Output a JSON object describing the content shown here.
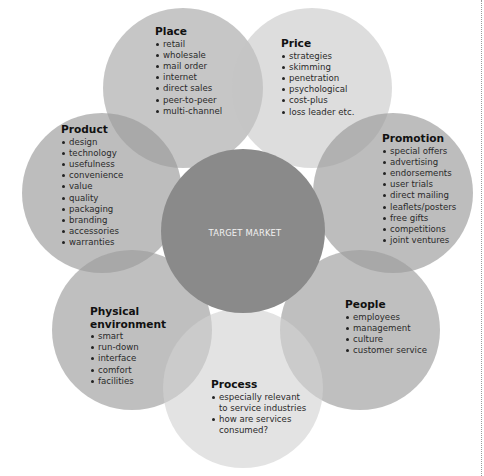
{
  "diagram": {
    "center": {
      "label": "TARGET MARKET",
      "color": "#8a8a8a"
    },
    "petals": [
      {
        "id": "place",
        "title": "Place",
        "color": "#c4c4c4",
        "items": [
          "retail",
          "wholesale",
          "mail order",
          "internet",
          "direct sales",
          "peer-to-peer",
          "multi-channel"
        ]
      },
      {
        "id": "price",
        "title": "Price",
        "color": "#dcdcdc",
        "items": [
          "strategies",
          "skimming",
          "penetration",
          "psychological",
          "cost-plus",
          "loss leader etc."
        ]
      },
      {
        "id": "promotion",
        "title": "Promotion",
        "color": "#b9b9b9",
        "items": [
          "special offers",
          "advertising",
          "endorsements",
          "user trials",
          "direct mailing",
          "leaflets/posters",
          "free gifts",
          "competitions",
          "joint ventures"
        ]
      },
      {
        "id": "people",
        "title": "People",
        "color": "#b4b4b4",
        "items": [
          "employees",
          "management",
          "culture",
          "customer service"
        ]
      },
      {
        "id": "process",
        "title": "Process",
        "color": "#dedede",
        "items": [
          "especially relevant to service industries",
          "how are services consumed?"
        ]
      },
      {
        "id": "physical-environment",
        "title": "Physical environment",
        "color": "#b7b7b7",
        "items": [
          "smart",
          "run-down",
          "interface",
          "comfort",
          "facilities"
        ]
      },
      {
        "id": "product",
        "title": "Product",
        "color": "#bababa",
        "items": [
          "design",
          "technology",
          "usefulness",
          "convenience",
          "value",
          "quality",
          "packaging",
          "branding",
          "accessories",
          "warranties"
        ]
      }
    ]
  }
}
